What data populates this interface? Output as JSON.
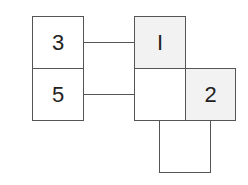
{
  "diagram": {
    "boxes": [
      {
        "id": "box-3",
        "label": "3",
        "fill": "#ffffff"
      },
      {
        "id": "box-5",
        "label": "5",
        "fill": "#ffffff"
      },
      {
        "id": "box-1",
        "label": "I",
        "fill": "#f2f2f2"
      },
      {
        "id": "box-empty-middle",
        "label": "",
        "fill": "#ffffff"
      },
      {
        "id": "box-2",
        "label": "2",
        "fill": "#f2f2f2"
      },
      {
        "id": "box-empty-bottom",
        "label": "",
        "fill": "#ffffff"
      }
    ],
    "connectors": [
      {
        "from": "box-3",
        "to": "box-1"
      },
      {
        "from": "box-5",
        "to": "box-empty-middle"
      }
    ],
    "colors": {
      "stroke": "#555555",
      "shaded": "#f2f2f2"
    }
  }
}
